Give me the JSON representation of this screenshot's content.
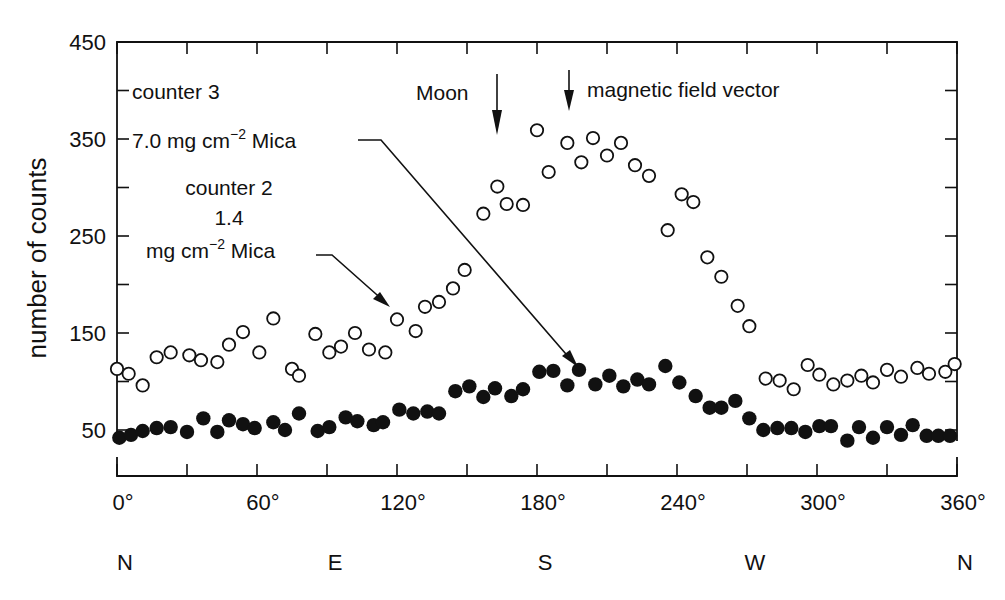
{
  "chart_data": {
    "type": "scatter",
    "title": "",
    "xlabel": "",
    "ylabel": "number of counts",
    "xlim": [
      0,
      360
    ],
    "ylim": [
      0,
      450
    ],
    "grid": false,
    "x_ticks": [
      {
        "value": 0,
        "label": "0°"
      },
      {
        "value": 60,
        "label": "60°"
      },
      {
        "value": 120,
        "label": "120°"
      },
      {
        "value": 180,
        "label": "180°"
      },
      {
        "value": 240,
        "label": "240°"
      },
      {
        "value": 300,
        "label": "300°"
      },
      {
        "value": 360,
        "label": "360°"
      }
    ],
    "x_minor_ticks": [
      30,
      90,
      150,
      210,
      270,
      330
    ],
    "y_ticks": [
      {
        "value": 50,
        "label": "50"
      },
      {
        "value": 150,
        "label": "150"
      },
      {
        "value": 250,
        "label": "250"
      },
      {
        "value": 350,
        "label": "350"
      },
      {
        "value": 450,
        "label": "450"
      }
    ],
    "y_minor_ticks": [
      100,
      200,
      300,
      400
    ],
    "compass_labels": [
      {
        "value": 0,
        "label": "N"
      },
      {
        "value": 90,
        "label": "E"
      },
      {
        "value": 180,
        "label": "S"
      },
      {
        "value": 270,
        "label": "W"
      },
      {
        "value": 360,
        "label": "N"
      }
    ],
    "annotations": {
      "counter3_line1": "counter 3",
      "counter3_line2_pre": "7.0 mg cm",
      "counter3_sup": "−2",
      "counter3_line2_post": " Mica",
      "counter2_line1": "counter 2",
      "counter2_line2": "1.4",
      "counter2_line3_pre": "mg cm",
      "counter2_sup": "−2",
      "counter2_line3_post": " Mica",
      "moon": "Moon",
      "magnetic": "magnetic field vector",
      "moon_x": 163,
      "magnetic_x": 195
    },
    "series": [
      {
        "name": "counter 3 (7.0 mg cm−2 Mica)",
        "marker": "open-circle",
        "x": [
          0,
          5,
          11,
          17,
          23,
          31,
          36,
          43,
          48,
          54,
          61,
          67,
          75,
          78,
          85,
          91,
          96,
          102,
          108,
          115,
          120,
          128,
          132,
          138,
          144,
          149,
          157,
          163,
          167,
          174,
          180,
          185,
          193,
          199,
          204,
          210,
          216,
          222,
          228,
          236,
          242,
          247,
          253,
          259,
          266,
          271,
          278,
          284,
          290,
          296,
          301,
          307,
          313,
          319,
          324,
          330,
          336,
          343,
          348,
          355,
          359
        ],
        "values": [
          113,
          108,
          96,
          125,
          130,
          127,
          122,
          120,
          138,
          151,
          130,
          165,
          113,
          106,
          149,
          130,
          136,
          150,
          133,
          130,
          164,
          152,
          177,
          182,
          196,
          215,
          273,
          301,
          283,
          282,
          359,
          316,
          346,
          326,
          351,
          333,
          346,
          323,
          312,
          256,
          293,
          285,
          228,
          208,
          178,
          157,
          103,
          101,
          92,
          117,
          107,
          97,
          101,
          106,
          99,
          112,
          105,
          114,
          108,
          110,
          118
        ]
      },
      {
        "name": "counter 2 (1.4 mg cm−2 Mica)",
        "marker": "filled-circle",
        "x": [
          1,
          6,
          11,
          17,
          23,
          30,
          37,
          43,
          48,
          54,
          59,
          67,
          72,
          78,
          86,
          91,
          98,
          103,
          110,
          114,
          121,
          127,
          133,
          138,
          145,
          151,
          157,
          162,
          169,
          174,
          181,
          187,
          193,
          198,
          205,
          211,
          217,
          223,
          228,
          235,
          241,
          248,
          254,
          259,
          265,
          271,
          277,
          283,
          289,
          295,
          301,
          306,
          313,
          318,
          324,
          330,
          336,
          341,
          347,
          352,
          357
        ],
        "values": [
          42,
          45,
          49,
          52,
          53,
          48,
          62,
          48,
          60,
          56,
          52,
          58,
          50,
          67,
          49,
          53,
          63,
          59,
          55,
          58,
          71,
          67,
          69,
          67,
          90,
          95,
          84,
          93,
          85,
          92,
          110,
          111,
          96,
          112,
          97,
          106,
          95,
          102,
          97,
          116,
          99,
          85,
          73,
          73,
          80,
          62,
          50,
          52,
          52,
          48,
          54,
          54,
          39,
          53,
          42,
          53,
          45,
          55,
          44,
          44,
          44
        ]
      }
    ]
  }
}
